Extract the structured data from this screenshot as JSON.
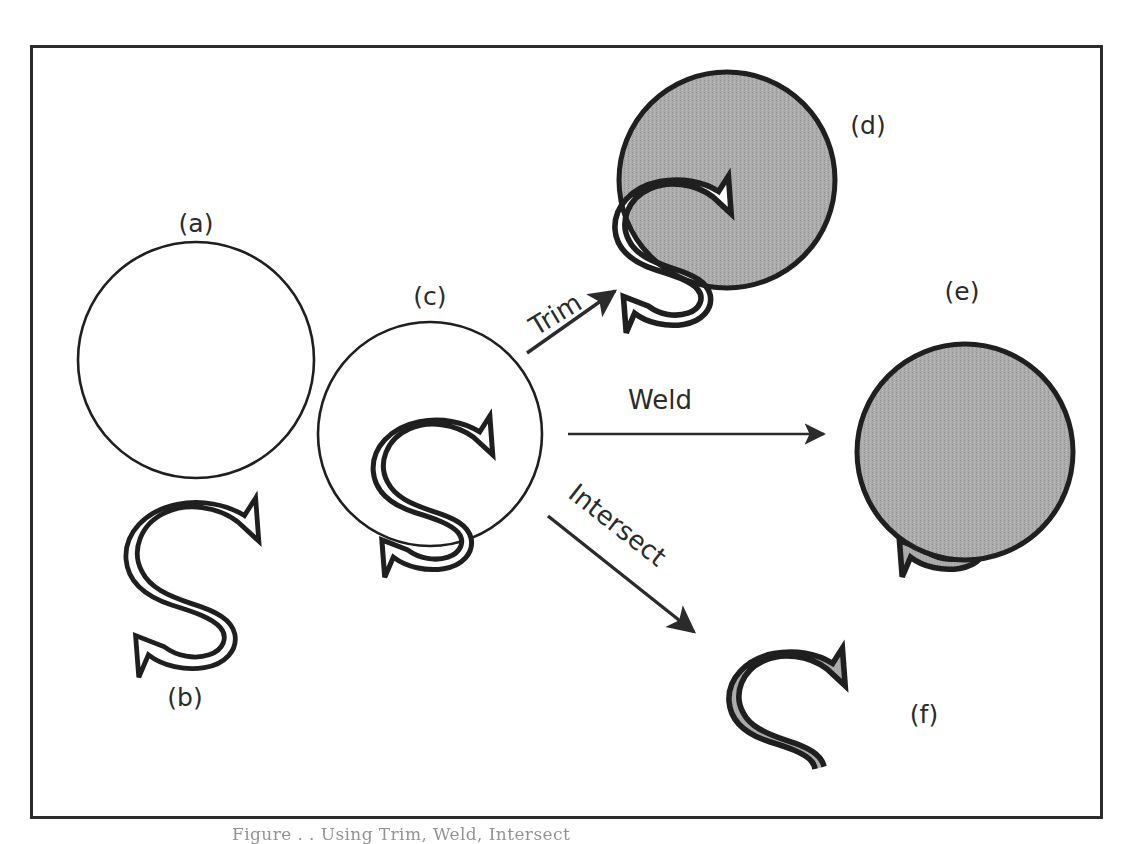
{
  "figure": {
    "frame": {
      "x": 30,
      "y": 45,
      "width": 1072,
      "height": 773,
      "stroke": "#2b2b2b",
      "stroke_width": 3
    },
    "colors": {
      "ink": "#2b2b2b",
      "outline": "#1f1f1f",
      "fill_gray": "#a8a8a8",
      "background": "#ffffff"
    },
    "panels": [
      {
        "id": "a",
        "label": "(a)",
        "description": "circle outline",
        "label_x": 196,
        "label_y": 232
      },
      {
        "id": "b",
        "label": "(b)",
        "description": "letter S outline",
        "label_x": 185,
        "label_y": 706
      },
      {
        "id": "c",
        "label": "(c)",
        "description": "circle overlapping letter S",
        "label_x": 430,
        "label_y": 305
      },
      {
        "id": "d",
        "label": "(d)",
        "description": "trim result: filled circle with S removed",
        "label_x": 868,
        "label_y": 134
      },
      {
        "id": "e",
        "label": "(e)",
        "description": "weld result: union of circle and S",
        "label_x": 962,
        "label_y": 300
      },
      {
        "id": "f",
        "label": "(f)",
        "description": "intersect result: overlap of circle and S",
        "label_x": 924,
        "label_y": 723
      }
    ],
    "operations": [
      {
        "id": "trim",
        "label": "Trim",
        "label_x": 560,
        "label_y": 322,
        "rotation": -31,
        "arrow": {
          "x1": 527,
          "y1": 353,
          "x2": 622,
          "y2": 287
        }
      },
      {
        "id": "weld",
        "label": "Weld",
        "label_x": 660,
        "label_y": 406,
        "rotation": 0,
        "arrow": {
          "x1": 568,
          "y1": 434,
          "x2": 830,
          "y2": 434
        }
      },
      {
        "id": "intersect",
        "label": "Intersect",
        "label_x": 605,
        "label_y": 534,
        "rotation": 31,
        "arrow": {
          "x1": 548,
          "y1": 516,
          "x2": 700,
          "y2": 637
        }
      }
    ],
    "caption": "Figure . . Using Trim, Weld, Intersect"
  }
}
